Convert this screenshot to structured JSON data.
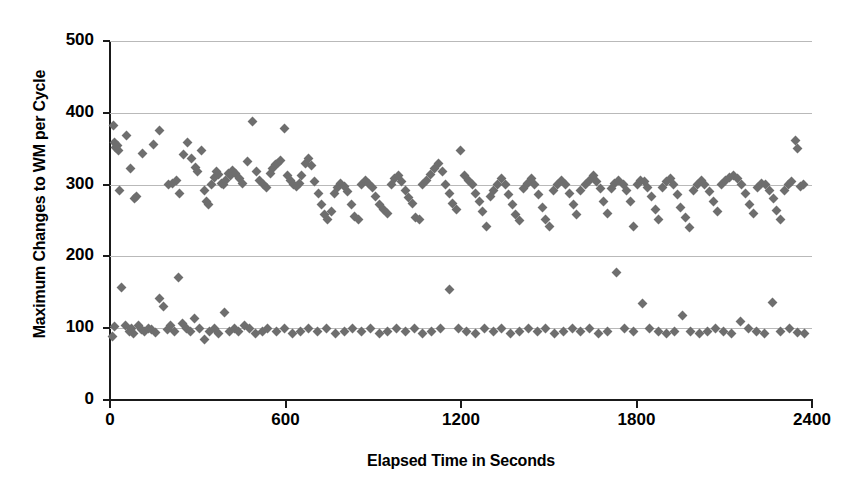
{
  "chart_data": {
    "type": "scatter",
    "title": "",
    "xlabel": "Elapsed Time in Seconds",
    "ylabel": "Maximum Changes to WM per Cycle",
    "xlim": [
      0,
      2400
    ],
    "ylim": [
      0,
      500
    ],
    "xticks": [
      0,
      600,
      1200,
      1800,
      2400
    ],
    "yticks": [
      0,
      100,
      200,
      300,
      400,
      500
    ],
    "xticklabels": [
      "0",
      "600",
      "1200",
      "1800",
      "2400"
    ],
    "yticklabels": [
      "0",
      "100",
      "200",
      "300",
      "400",
      "500"
    ],
    "grid": "horizontal",
    "legend": "none",
    "marker": "diamond",
    "marker_color": "#6e6e6e",
    "axis_color": "#1a1a1a",
    "grid_color": "#b9b9b9",
    "background": "#ffffff",
    "series": [
      {
        "name": "Maximum changes to working memory per cycle",
        "points": [
          [
            12,
            382
          ],
          [
            16,
            358
          ],
          [
            20,
            352
          ],
          [
            26,
            354
          ],
          [
            30,
            348
          ],
          [
            34,
            292
          ],
          [
            58,
            368
          ],
          [
            70,
            322
          ],
          [
            84,
            280
          ],
          [
            92,
            284
          ],
          [
            110,
            344
          ],
          [
            150,
            356
          ],
          [
            170,
            376
          ],
          [
            200,
            300
          ],
          [
            215,
            302
          ],
          [
            228,
            306
          ],
          [
            236,
            288
          ],
          [
            252,
            342
          ],
          [
            266,
            358
          ],
          [
            278,
            336
          ],
          [
            292,
            324
          ],
          [
            300,
            318
          ],
          [
            312,
            348
          ],
          [
            322,
            292
          ],
          [
            330,
            276
          ],
          [
            338,
            272
          ],
          [
            346,
            300
          ],
          [
            356,
            310
          ],
          [
            364,
            318
          ],
          [
            372,
            314
          ],
          [
            380,
            302
          ],
          [
            388,
            300
          ],
          [
            396,
            306
          ],
          [
            404,
            316
          ],
          [
            412,
            312
          ],
          [
            420,
            320
          ],
          [
            430,
            316
          ],
          [
            442,
            308
          ],
          [
            452,
            302
          ],
          [
            470,
            332
          ],
          [
            486,
            388
          ],
          [
            500,
            318
          ],
          [
            512,
            306
          ],
          [
            524,
            300
          ],
          [
            534,
            296
          ],
          [
            548,
            316
          ],
          [
            556,
            322
          ],
          [
            566,
            328
          ],
          [
            574,
            330
          ],
          [
            584,
            334
          ],
          [
            596,
            378
          ],
          [
            608,
            312
          ],
          [
            618,
            306
          ],
          [
            628,
            300
          ],
          [
            638,
            298
          ],
          [
            648,
            302
          ],
          [
            656,
            312
          ],
          [
            668,
            330
          ],
          [
            680,
            336
          ],
          [
            690,
            326
          ],
          [
            700,
            304
          ],
          [
            712,
            288
          ],
          [
            722,
            272
          ],
          [
            734,
            258
          ],
          [
            744,
            252
          ],
          [
            756,
            262
          ],
          [
            768,
            288
          ],
          [
            778,
            296
          ],
          [
            788,
            302
          ],
          [
            800,
            298
          ],
          [
            812,
            290
          ],
          [
            824,
            272
          ],
          [
            836,
            256
          ],
          [
            848,
            252
          ],
          [
            860,
            300
          ],
          [
            872,
            306
          ],
          [
            884,
            302
          ],
          [
            896,
            296
          ],
          [
            908,
            284
          ],
          [
            920,
            272
          ],
          [
            934,
            266
          ],
          [
            948,
            260
          ],
          [
            962,
            300
          ],
          [
            974,
            308
          ],
          [
            986,
            312
          ],
          [
            998,
            304
          ],
          [
            1010,
            292
          ],
          [
            1022,
            282
          ],
          [
            1034,
            274
          ],
          [
            1046,
            254
          ],
          [
            1058,
            252
          ],
          [
            1070,
            300
          ],
          [
            1082,
            306
          ],
          [
            1096,
            314
          ],
          [
            1110,
            322
          ],
          [
            1124,
            330
          ],
          [
            1136,
            318
          ],
          [
            1148,
            300
          ],
          [
            1160,
            288
          ],
          [
            1172,
            274
          ],
          [
            1184,
            266
          ],
          [
            1198,
            348
          ],
          [
            1212,
            312
          ],
          [
            1226,
            306
          ],
          [
            1238,
            300
          ],
          [
            1250,
            288
          ],
          [
            1262,
            276
          ],
          [
            1274,
            262
          ],
          [
            1286,
            242
          ],
          [
            1300,
            284
          ],
          [
            1312,
            292
          ],
          [
            1326,
            300
          ],
          [
            1340,
            308
          ],
          [
            1352,
            300
          ],
          [
            1364,
            286
          ],
          [
            1376,
            272
          ],
          [
            1388,
            258
          ],
          [
            1400,
            250
          ],
          [
            1414,
            294
          ],
          [
            1428,
            302
          ],
          [
            1440,
            308
          ],
          [
            1452,
            300
          ],
          [
            1466,
            286
          ],
          [
            1478,
            268
          ],
          [
            1490,
            252
          ],
          [
            1504,
            242
          ],
          [
            1516,
            292
          ],
          [
            1530,
            300
          ],
          [
            1544,
            306
          ],
          [
            1558,
            300
          ],
          [
            1570,
            288
          ],
          [
            1584,
            272
          ],
          [
            1596,
            258
          ],
          [
            1610,
            292
          ],
          [
            1624,
            300
          ],
          [
            1638,
            306
          ],
          [
            1652,
            312
          ],
          [
            1664,
            304
          ],
          [
            1676,
            294
          ],
          [
            1688,
            276
          ],
          [
            1700,
            260
          ],
          [
            1714,
            294
          ],
          [
            1726,
            302
          ],
          [
            1740,
            306
          ],
          [
            1754,
            300
          ],
          [
            1766,
            292
          ],
          [
            1778,
            276
          ],
          [
            1790,
            242
          ],
          [
            1802,
            300
          ],
          [
            1814,
            306
          ],
          [
            1826,
            304
          ],
          [
            1838,
            296
          ],
          [
            1852,
            284
          ],
          [
            1864,
            266
          ],
          [
            1876,
            252
          ],
          [
            1890,
            296
          ],
          [
            1902,
            304
          ],
          [
            1916,
            308
          ],
          [
            1928,
            300
          ],
          [
            1940,
            286
          ],
          [
            1952,
            268
          ],
          [
            1966,
            254
          ],
          [
            1980,
            240
          ],
          [
            1994,
            292
          ],
          [
            2008,
            300
          ],
          [
            2022,
            306
          ],
          [
            2034,
            300
          ],
          [
            2048,
            290
          ],
          [
            2062,
            276
          ],
          [
            2076,
            262
          ],
          [
            2090,
            300
          ],
          [
            2104,
            306
          ],
          [
            2118,
            310
          ],
          [
            2132,
            312
          ],
          [
            2146,
            308
          ],
          [
            2160,
            300
          ],
          [
            2172,
            288
          ],
          [
            2186,
            272
          ],
          [
            2200,
            260
          ],
          [
            2214,
            296
          ],
          [
            2228,
            302
          ],
          [
            2242,
            300
          ],
          [
            2256,
            292
          ],
          [
            2268,
            280
          ],
          [
            2280,
            264
          ],
          [
            2292,
            252
          ],
          [
            2306,
            292
          ],
          [
            2318,
            300
          ],
          [
            2330,
            304
          ],
          [
            2344,
            362
          ],
          [
            2352,
            350
          ],
          [
            2360,
            298
          ],
          [
            2370,
            300
          ],
          [
            8,
            88
          ],
          [
            16,
            102
          ],
          [
            40,
            156
          ],
          [
            54,
            104
          ],
          [
            66,
            96
          ],
          [
            74,
            100
          ],
          [
            82,
            92
          ],
          [
            96,
            104
          ],
          [
            106,
            98
          ],
          [
            118,
            96
          ],
          [
            130,
            100
          ],
          [
            142,
            98
          ],
          [
            156,
            94
          ],
          [
            170,
            142
          ],
          [
            184,
            130
          ],
          [
            196,
            98
          ],
          [
            208,
            104
          ],
          [
            222,
            96
          ],
          [
            234,
            170
          ],
          [
            248,
            106
          ],
          [
            262,
            100
          ],
          [
            276,
            96
          ],
          [
            290,
            114
          ],
          [
            306,
            100
          ],
          [
            322,
            84
          ],
          [
            340,
            96
          ],
          [
            356,
            100
          ],
          [
            372,
            92
          ],
          [
            392,
            122
          ],
          [
            408,
            96
          ],
          [
            424,
            100
          ],
          [
            440,
            96
          ],
          [
            460,
            104
          ],
          [
            478,
            100
          ],
          [
            496,
            92
          ],
          [
            520,
            96
          ],
          [
            540,
            100
          ],
          [
            568,
            96
          ],
          [
            596,
            100
          ],
          [
            624,
            92
          ],
          [
            652,
            96
          ],
          [
            680,
            100
          ],
          [
            710,
            96
          ],
          [
            740,
            100
          ],
          [
            770,
            92
          ],
          [
            800,
            96
          ],
          [
            830,
            100
          ],
          [
            860,
            96
          ],
          [
            890,
            100
          ],
          [
            920,
            92
          ],
          [
            950,
            96
          ],
          [
            980,
            100
          ],
          [
            1010,
            96
          ],
          [
            1040,
            100
          ],
          [
            1070,
            92
          ],
          [
            1100,
            96
          ],
          [
            1130,
            100
          ],
          [
            1160,
            154
          ],
          [
            1190,
            100
          ],
          [
            1220,
            96
          ],
          [
            1250,
            92
          ],
          [
            1280,
            100
          ],
          [
            1310,
            96
          ],
          [
            1340,
            100
          ],
          [
            1370,
            92
          ],
          [
            1400,
            96
          ],
          [
            1430,
            100
          ],
          [
            1460,
            96
          ],
          [
            1490,
            100
          ],
          [
            1520,
            92
          ],
          [
            1550,
            96
          ],
          [
            1580,
            100
          ],
          [
            1610,
            96
          ],
          [
            1640,
            100
          ],
          [
            1670,
            92
          ],
          [
            1700,
            96
          ],
          [
            1730,
            178
          ],
          [
            1760,
            100
          ],
          [
            1790,
            96
          ],
          [
            1820,
            134
          ],
          [
            1846,
            100
          ],
          [
            1874,
            96
          ],
          [
            1902,
            92
          ],
          [
            1930,
            96
          ],
          [
            1958,
            118
          ],
          [
            1986,
            96
          ],
          [
            2014,
            92
          ],
          [
            2042,
            96
          ],
          [
            2070,
            100
          ],
          [
            2098,
            96
          ],
          [
            2126,
            92
          ],
          [
            2154,
            110
          ],
          [
            2182,
            100
          ],
          [
            2210,
            96
          ],
          [
            2238,
            92
          ],
          [
            2266,
            136
          ],
          [
            2294,
            96
          ],
          [
            2322,
            100
          ],
          [
            2350,
            94
          ],
          [
            2376,
            92
          ]
        ]
      }
    ]
  }
}
